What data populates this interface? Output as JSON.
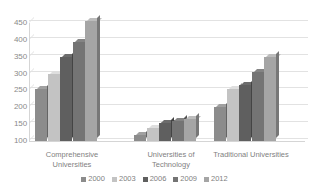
{
  "chart_data": {
    "type": "bar",
    "title": "",
    "subtitle": "",
    "xlabel": "",
    "ylabel": "",
    "categories": [
      "Comprehensive Universities",
      "Universities of Technology",
      "Traditional Universities"
    ],
    "series": [
      {
        "name": "2000",
        "color": "#8c8c8c",
        "values": [
          255,
          118,
          200
        ]
      },
      {
        "name": "2003",
        "color": "#c3c3c3",
        "values": [
          300,
          140,
          255
        ]
      },
      {
        "name": "2006",
        "color": "#5f5f5f",
        "values": [
          350,
          152,
          265
        ]
      },
      {
        "name": "2009",
        "color": "#747474",
        "values": [
          395,
          158,
          305
        ]
      },
      {
        "name": "2012",
        "color": "#a5a5a5",
        "values": [
          455,
          165,
          350
        ]
      }
    ],
    "ylim": [
      100,
      450
    ],
    "yticks": [
      100,
      150,
      200,
      250,
      300,
      350,
      400,
      450
    ],
    "ytick_labels": [
      "100",
      "150",
      "200",
      "250",
      "300",
      "350",
      "400",
      "450"
    ],
    "grid": true,
    "legend_position": "bottom",
    "style": "3d-clustered-column",
    "axis_color": "#d5d5d5",
    "gridline_color": "#e2e2e2",
    "text_color": "#7f7f7f",
    "background": "#ffffff"
  },
  "category_labels": [
    {
      "line1": "Comprehensive",
      "line2": "Universities"
    },
    {
      "line1": "Universities of",
      "line2": "Technology"
    },
    {
      "line1": "Traditional Universities",
      "line2": ""
    }
  ]
}
